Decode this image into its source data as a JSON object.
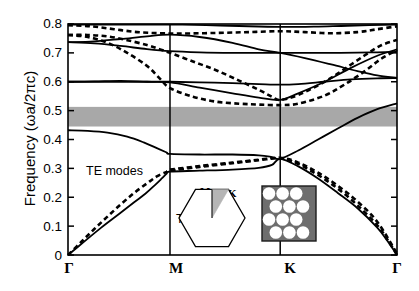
{
  "chart_data": {
    "type": "line",
    "title": "",
    "xlabel": "",
    "ylabel": "Frequency  (ωa/2πc)",
    "ylim": [
      0,
      0.8
    ],
    "yticks": [
      "0",
      "0.1",
      "0.2",
      "0.3",
      "0.4",
      "0.5",
      "0.6",
      "0.7",
      "0.8"
    ],
    "ytick_values": [
      0,
      0.1,
      0.2,
      0.3,
      0.4,
      0.5,
      0.6,
      0.7,
      0.8
    ],
    "xticks": [
      "Γ",
      "M",
      "K",
      "Γ"
    ],
    "xtick_positions": [
      0,
      0.31,
      0.645,
      1.0
    ],
    "grid": false,
    "legend_position": "inline-annotation",
    "annotations": [
      {
        "text": "Photonic Band Gap",
        "x": 0.5,
        "y": 0.5
      },
      {
        "text": "TE modes",
        "x": 0.09,
        "y": 0.31
      },
      {
        "text": "TM modes",
        "x": 0.25,
        "y": 0.145
      }
    ],
    "band_gap": {
      "label": "Photonic Band Gap",
      "ymin": 0.445,
      "ymax": 0.513,
      "color": "#a8a8a8"
    },
    "series": [
      {
        "name": "TM modes",
        "style": "solid",
        "color": "#000000",
        "bands": [
          [
            [
              0,
              0.0
            ],
            [
              0.05,
              0.047
            ],
            [
              0.1,
              0.094
            ],
            [
              0.155,
              0.142
            ],
            [
              0.2,
              0.182
            ],
            [
              0.235,
              0.212
            ],
            [
              0.265,
              0.243
            ],
            [
              0.285,
              0.265
            ],
            [
              0.3,
              0.282
            ],
            [
              0.31,
              0.289
            ],
            [
              0.4,
              0.292
            ],
            [
              0.5,
              0.296
            ],
            [
              0.58,
              0.302
            ],
            [
              0.62,
              0.312
            ],
            [
              0.645,
              0.333
            ],
            [
              0.7,
              0.307
            ],
            [
              0.76,
              0.265
            ],
            [
              0.82,
              0.215
            ],
            [
              0.88,
              0.162
            ],
            [
              0.94,
              0.095
            ],
            [
              0.97,
              0.05
            ],
            [
              1.0,
              0.0
            ]
          ],
          [
            [
              0,
              0.432
            ],
            [
              0.06,
              0.43
            ],
            [
              0.12,
              0.424
            ],
            [
              0.18,
              0.41
            ],
            [
              0.23,
              0.39
            ],
            [
              0.27,
              0.37
            ],
            [
              0.3,
              0.355
            ],
            [
              0.31,
              0.35
            ],
            [
              0.4,
              0.348
            ],
            [
              0.5,
              0.348
            ],
            [
              0.58,
              0.345
            ],
            [
              0.62,
              0.339
            ],
            [
              0.645,
              0.333
            ],
            [
              0.7,
              0.362
            ],
            [
              0.76,
              0.4
            ],
            [
              0.82,
              0.438
            ],
            [
              0.88,
              0.475
            ],
            [
              0.94,
              0.505
            ],
            [
              1.0,
              0.525
            ]
          ],
          [
            [
              0,
              0.6
            ],
            [
              0.08,
              0.6
            ],
            [
              0.16,
              0.6
            ],
            [
              0.24,
              0.6
            ],
            [
              0.31,
              0.6
            ],
            [
              0.4,
              0.598
            ],
            [
              0.5,
              0.595
            ],
            [
              0.58,
              0.592
            ],
            [
              0.645,
              0.59
            ],
            [
              0.7,
              0.592
            ],
            [
              0.78,
              0.6
            ],
            [
              0.86,
              0.608
            ],
            [
              0.94,
              0.612
            ],
            [
              1.0,
              0.613
            ]
          ],
          [
            [
              0,
              0.6
            ],
            [
              0.08,
              0.601
            ],
            [
              0.16,
              0.603
            ],
            [
              0.24,
              0.6
            ],
            [
              0.31,
              0.598
            ],
            [
              0.4,
              0.58
            ],
            [
              0.5,
              0.56
            ],
            [
              0.58,
              0.545
            ],
            [
              0.645,
              0.537
            ],
            [
              0.7,
              0.56
            ],
            [
              0.78,
              0.6
            ],
            [
              0.86,
              0.648
            ],
            [
              0.94,
              0.69
            ],
            [
              1.0,
              0.712
            ]
          ],
          [
            [
              0,
              0.737
            ],
            [
              0.08,
              0.733
            ],
            [
              0.16,
              0.724
            ],
            [
              0.24,
              0.713
            ],
            [
              0.31,
              0.706
            ],
            [
              0.4,
              0.702
            ],
            [
              0.5,
              0.7
            ],
            [
              0.58,
              0.7
            ],
            [
              0.645,
              0.7
            ],
            [
              0.72,
              0.7
            ],
            [
              0.8,
              0.7
            ],
            [
              0.88,
              0.701
            ],
            [
              0.94,
              0.702
            ],
            [
              1.0,
              0.703
            ]
          ],
          [
            [
              0,
              0.737
            ],
            [
              0.08,
              0.74
            ],
            [
              0.16,
              0.748
            ],
            [
              0.24,
              0.757
            ],
            [
              0.31,
              0.763
            ],
            [
              0.4,
              0.755
            ],
            [
              0.5,
              0.735
            ],
            [
              0.58,
              0.712
            ],
            [
              0.645,
              0.7
            ],
            [
              0.72,
              0.682
            ],
            [
              0.8,
              0.66
            ],
            [
              0.88,
              0.637
            ],
            [
              0.94,
              0.622
            ],
            [
              1.0,
              0.613
            ]
          ],
          [
            [
              0,
              0.798
            ],
            [
              0.1,
              0.798
            ],
            [
              0.2,
              0.798
            ],
            [
              0.31,
              0.798
            ],
            [
              0.42,
              0.796
            ],
            [
              0.52,
              0.793
            ],
            [
              0.645,
              0.79
            ],
            [
              0.75,
              0.791
            ],
            [
              0.85,
              0.794
            ],
            [
              1.0,
              0.798
            ]
          ]
        ]
      },
      {
        "name": "TE modes",
        "style": "dashed",
        "color": "#000000",
        "bands": [
          [
            [
              0,
              0.0
            ],
            [
              0.04,
              0.045
            ],
            [
              0.08,
              0.09
            ],
            [
              0.12,
              0.133
            ],
            [
              0.16,
              0.175
            ],
            [
              0.2,
              0.214
            ],
            [
              0.24,
              0.248
            ],
            [
              0.27,
              0.272
            ],
            [
              0.3,
              0.288
            ],
            [
              0.31,
              0.292
            ],
            [
              0.4,
              0.305
            ],
            [
              0.5,
              0.318
            ],
            [
              0.58,
              0.328
            ],
            [
              0.645,
              0.335
            ],
            [
              0.7,
              0.315
            ],
            [
              0.76,
              0.277
            ],
            [
              0.82,
              0.23
            ],
            [
              0.88,
              0.172
            ],
            [
              0.94,
              0.103
            ],
            [
              0.97,
              0.055
            ],
            [
              1.0,
              0.0
            ]
          ],
          [
            [
              0.31,
              0.296
            ],
            [
              0.4,
              0.308
            ],
            [
              0.5,
              0.32
            ],
            [
              0.58,
              0.33
            ],
            [
              0.645,
              0.337
            ],
            [
              0.7,
              0.32
            ],
            [
              0.76,
              0.285
            ],
            [
              0.82,
              0.24
            ],
            [
              0.88,
              0.185
            ],
            [
              0.94,
              0.115
            ],
            [
              1.0,
              0.005
            ]
          ],
          [
            [
              0,
              0.762
            ],
            [
              0.06,
              0.755
            ],
            [
              0.12,
              0.735
            ],
            [
              0.18,
              0.7
            ],
            [
              0.24,
              0.655
            ],
            [
              0.28,
              0.61
            ],
            [
              0.31,
              0.578
            ],
            [
              0.38,
              0.548
            ],
            [
              0.45,
              0.531
            ],
            [
              0.52,
              0.524
            ],
            [
              0.58,
              0.521
            ],
            [
              0.645,
              0.519
            ],
            [
              0.7,
              0.524
            ],
            [
              0.78,
              0.552
            ],
            [
              0.84,
              0.59
            ],
            [
              0.9,
              0.635
            ],
            [
              0.95,
              0.678
            ],
            [
              1.0,
              0.71
            ]
          ],
          [
            [
              0,
              0.762
            ],
            [
              0.06,
              0.762
            ],
            [
              0.12,
              0.757
            ],
            [
              0.18,
              0.744
            ],
            [
              0.24,
              0.727
            ],
            [
              0.28,
              0.712
            ],
            [
              0.31,
              0.7
            ],
            [
              0.38,
              0.67
            ],
            [
              0.45,
              0.64
            ],
            [
              0.52,
              0.604
            ],
            [
              0.58,
              0.572
            ],
            [
              0.62,
              0.548
            ],
            [
              0.645,
              0.537
            ],
            [
              0.7,
              0.554
            ],
            [
              0.78,
              0.6
            ],
            [
              0.84,
              0.644
            ],
            [
              0.9,
              0.69
            ],
            [
              0.95,
              0.725
            ],
            [
              1.0,
              0.745
            ]
          ],
          [
            [
              0,
              0.796
            ],
            [
              0.07,
              0.792
            ],
            [
              0.14,
              0.782
            ],
            [
              0.21,
              0.772
            ],
            [
              0.28,
              0.768
            ],
            [
              0.35,
              0.767
            ],
            [
              0.45,
              0.769
            ],
            [
              0.55,
              0.772
            ],
            [
              0.645,
              0.775
            ],
            [
              0.72,
              0.772
            ],
            [
              0.8,
              0.768
            ],
            [
              0.88,
              0.772
            ],
            [
              0.94,
              0.782
            ],
            [
              1.0,
              0.792
            ]
          ]
        ]
      }
    ],
    "insets": [
      {
        "name": "brillouin-zone",
        "shape": "hexagon",
        "labels": [
          {
            "text": "M",
            "position": "top"
          },
          {
            "text": "K",
            "position": "top-right"
          },
          {
            "text": "Γ",
            "position": "center"
          }
        ],
        "wedge_color": "#b5b5b5"
      },
      {
        "name": "crystal-lattice",
        "shape": "square-with-circles",
        "background_color": "#6e6e6e",
        "circle_color": "#ffffff",
        "rows": 4,
        "description": "triangular lattice of air holes"
      }
    ]
  }
}
